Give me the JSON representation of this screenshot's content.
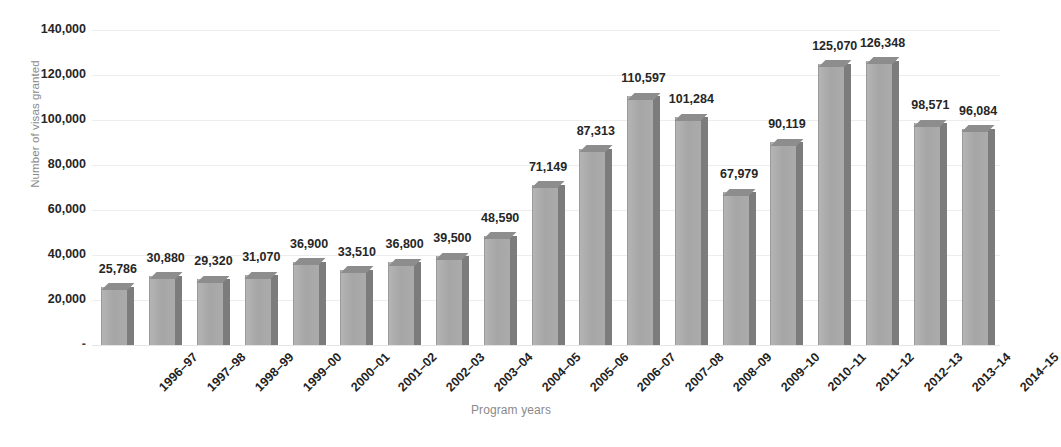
{
  "chart_data": {
    "type": "bar",
    "title": "",
    "xlabel": "Program years",
    "ylabel": "Number of visas granted",
    "ylim": [
      0,
      140000
    ],
    "ytick_labels": [
      "140,000",
      "120,000",
      "100,000",
      "80,000",
      "60,000",
      "40,000",
      "20,000",
      "-"
    ],
    "ytick_values": [
      140000,
      120000,
      100000,
      80000,
      60000,
      40000,
      20000,
      0
    ],
    "grid": true,
    "legend": "none",
    "style": "3d-column",
    "bar_color_front": "#a8a8a8",
    "bar_color_side": "#7c7c7c",
    "bar_color_top": "#8d8d8d",
    "categories": [
      "1996–97",
      "1997–98",
      "1998–99",
      "1999–00",
      "2000–01",
      "2001–02",
      "2002–03",
      "2003–04",
      "2004–05",
      "2005–06",
      "2006–07",
      "2007–08",
      "2008–09",
      "2009–10",
      "2010–11",
      "2011–12",
      "2012–13",
      "2013–14",
      "2014–15"
    ],
    "values": [
      25786,
      30880,
      29320,
      31070,
      36900,
      33510,
      36800,
      39500,
      48590,
      71149,
      87313,
      110597,
      101284,
      67979,
      90119,
      125070,
      126348,
      98571,
      96084
    ],
    "data_labels": [
      "25,786",
      "30,880",
      "29,320",
      "31,070",
      "36,900",
      "33,510",
      "36,800",
      "39,500",
      "48,590",
      "71,149",
      "87,313",
      "110,597",
      "101,284",
      "67,979",
      "90,119",
      "125,070",
      "126,348",
      "98,571",
      "96,084"
    ]
  }
}
